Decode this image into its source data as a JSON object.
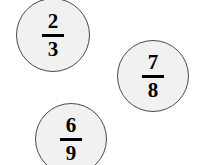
{
  "page": {
    "background_color": "#ffffff",
    "width": 200,
    "height": 165
  },
  "style": {
    "circle_fill": "#f1f1f1",
    "circle_stroke": "#4a4a4a",
    "text_color": "#000000"
  },
  "circles": [
    {
      "name": "fraction-circle-two-thirds",
      "numerator": "2",
      "denominator": "3",
      "fraction_text": "2/3",
      "left": 16,
      "top": -2,
      "diameter": 74,
      "clipped": "top"
    },
    {
      "name": "fraction-circle-seven-eighths",
      "numerator": "7",
      "denominator": "8",
      "fraction_text": "7/8",
      "left": 117,
      "top": 40,
      "diameter": 72,
      "clipped": "none"
    },
    {
      "name": "fraction-circle-six-ninths",
      "numerator": "6",
      "denominator": "9",
      "fraction_text": "6/9",
      "left": 35,
      "top": 103,
      "diameter": 72,
      "clipped": "bottom"
    }
  ]
}
